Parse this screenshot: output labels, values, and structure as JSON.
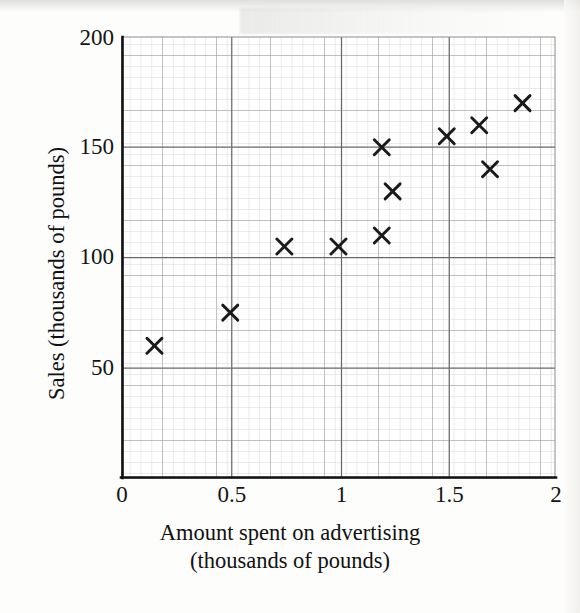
{
  "chart_data": {
    "type": "scatter",
    "title": "",
    "xlabel": "Amount spent on advertising (thousands of pounds)",
    "xlabel_line1": "Amount spent on advertising",
    "xlabel_line2": "(thousands of pounds)",
    "ylabel": "Sales (thousands of pounds)",
    "xlim": [
      0,
      2
    ],
    "ylim": [
      0,
      200
    ],
    "xticks": [
      0,
      0.5,
      1,
      1.5,
      2
    ],
    "xtick_labels": [
      "0",
      "0.5",
      "1",
      "1.5",
      "2"
    ],
    "yticks": [
      50,
      100,
      150,
      200
    ],
    "ytick_labels": [
      "50",
      "100",
      "150",
      "200"
    ],
    "grid": "graph-paper: minor every 0.025 on x and 2.5 on y, major every 0.125 on x and 12.5 on y, heavy at ticks",
    "legend": null,
    "marker": "x",
    "marker_color": "#1a1a1a",
    "points": [
      {
        "x": 0.15,
        "y": 60
      },
      {
        "x": 0.5,
        "y": 75
      },
      {
        "x": 0.75,
        "y": 105
      },
      {
        "x": 1.0,
        "y": 105
      },
      {
        "x": 1.2,
        "y": 150
      },
      {
        "x": 1.25,
        "y": 130
      },
      {
        "x": 1.2,
        "y": 110
      },
      {
        "x": 1.5,
        "y": 155
      },
      {
        "x": 1.65,
        "y": 160
      },
      {
        "x": 1.7,
        "y": 140
      },
      {
        "x": 1.85,
        "y": 170
      }
    ]
  },
  "axis": {
    "x_labels": [
      "0",
      "0.5",
      "1",
      "1.5",
      "2"
    ],
    "y_labels": [
      "50",
      "100",
      "150",
      "200"
    ]
  }
}
